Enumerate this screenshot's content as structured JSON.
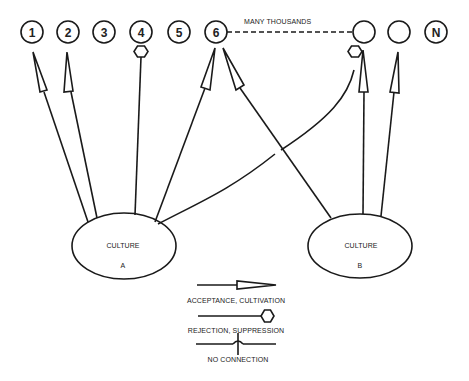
{
  "diagram": {
    "nodes": [
      {
        "id": "1",
        "label": "1",
        "cx": 32,
        "cy": 32
      },
      {
        "id": "2",
        "label": "2",
        "cx": 68,
        "cy": 32
      },
      {
        "id": "3",
        "label": "3",
        "cx": 104,
        "cy": 32
      },
      {
        "id": "4",
        "label": "4",
        "cx": 141,
        "cy": 32
      },
      {
        "id": "5",
        "label": "5",
        "cx": 179,
        "cy": 32
      },
      {
        "id": "6",
        "label": "6",
        "cx": 216,
        "cy": 32
      },
      {
        "id": "blank1",
        "label": "",
        "cx": 364,
        "cy": 32
      },
      {
        "id": "blank2",
        "label": "",
        "cx": 399,
        "cy": 32
      },
      {
        "id": "N",
        "label": "N",
        "cx": 436,
        "cy": 32
      }
    ],
    "many_thousands_label": "MANY THOUSANDS",
    "cultures": [
      {
        "id": "A",
        "title": "CULTURE",
        "letter": "A"
      },
      {
        "id": "B",
        "title": "CULTURE",
        "letter": "B"
      }
    ],
    "edges": [
      {
        "from": "A",
        "to": "1",
        "type": "acceptance"
      },
      {
        "from": "A",
        "to": "2",
        "type": "acceptance"
      },
      {
        "from": "A",
        "to": "4",
        "type": "rejection"
      },
      {
        "from": "A",
        "to": "6",
        "type": "acceptance"
      },
      {
        "from": "A",
        "to": "blank1",
        "type": "rejection"
      },
      {
        "from": "B",
        "to": "6",
        "type": "acceptance"
      },
      {
        "from": "B",
        "to": "blank1",
        "type": "acceptance"
      },
      {
        "from": "B",
        "to": "blank2",
        "type": "acceptance"
      }
    ],
    "legend": {
      "acceptance": "ACCEPTANCE, CULTIVATION",
      "rejection": "REJECTION, SUPPRESSION",
      "no_connection": "NO CONNECTION"
    }
  }
}
